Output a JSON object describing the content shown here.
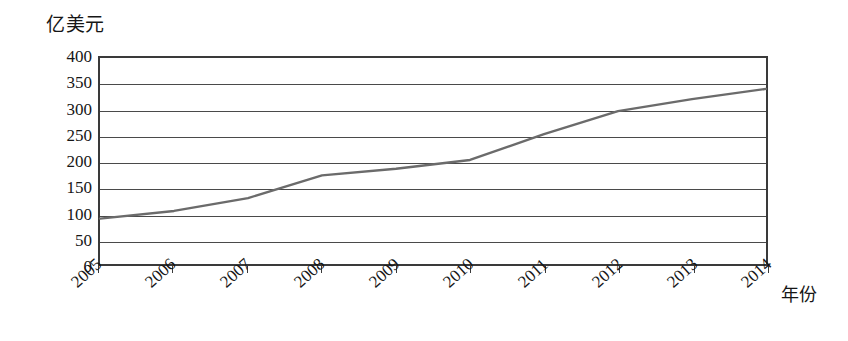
{
  "chart_data": {
    "type": "line",
    "title": "",
    "subtitle": "",
    "xlabel": "年份",
    "ylabel": "亿美元",
    "x": [
      2005,
      2006,
      2007,
      2008,
      2009,
      2010,
      2011,
      2012,
      2013,
      2014
    ],
    "categories": [
      "2005",
      "2006",
      "2007",
      "2008",
      "2009",
      "2010",
      "2011",
      "2012",
      "2013",
      "2014"
    ],
    "values": [
      88,
      103,
      128,
      172,
      185,
      202,
      252,
      297,
      320,
      340
    ],
    "series": [
      {
        "name": "亿美元",
        "values": [
          88,
          103,
          128,
          172,
          185,
          202,
          252,
          297,
          320,
          340
        ]
      }
    ],
    "ylim": [
      0,
      400
    ],
    "yticks": [
      0,
      50,
      100,
      150,
      200,
      250,
      300,
      350,
      400
    ],
    "ytick_labels": [
      "400",
      "350",
      "300",
      "250",
      "200",
      "150",
      "100",
      "50",
      "0"
    ],
    "xlim": [
      2005,
      2014
    ],
    "grid": "horizontal",
    "legend": "none",
    "line_color": "#6b6b6b",
    "frame_color": "#3a3a3a",
    "grid_color": "#4a4a4a",
    "annotations": []
  },
  "axes": {
    "y_unit_label": "亿美元",
    "x_axis_title": "年份"
  }
}
